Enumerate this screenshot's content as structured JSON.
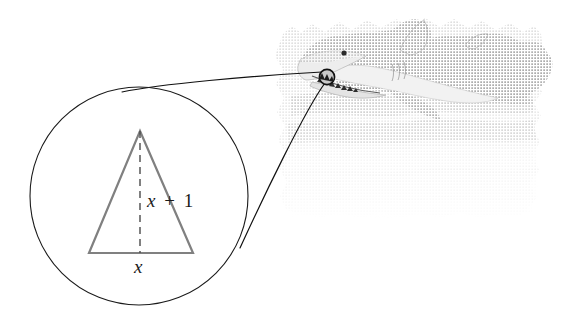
{
  "figure": {
    "kind": "math-textbook-illustration",
    "background_color": "#ffffff"
  },
  "magnifier": {
    "circle": {
      "center_x": 139,
      "center_y": 196,
      "radius": 109,
      "stroke_color": "#1a1a1a",
      "stroke_width": 1.1,
      "fill": "none"
    },
    "leader_lines": {
      "stroke_color": "#111111",
      "stroke_width": 1.2,
      "upper": {
        "x1": 146,
        "y1": 88,
        "x2": 325,
        "y2": 73
      },
      "lower": {
        "x1": 243,
        "y1": 246,
        "x2": 327,
        "y2": 84
      }
    }
  },
  "triangle": {
    "stroke_color": "#808080",
    "stroke_width": 2.2,
    "apex": {
      "x": 140,
      "y": 131
    },
    "base_left": {
      "x": 89,
      "y": 253
    },
    "base_right": {
      "x": 193,
      "y": 253
    },
    "altitude": {
      "from": {
        "x": 140,
        "y": 131
      },
      "to": {
        "x": 140,
        "y": 253
      },
      "dash_pattern": "7,5",
      "stroke_color": "#4a4a4a",
      "stroke_width": 1.4
    }
  },
  "labels": {
    "height": {
      "variable": "x",
      "operator": "+",
      "constant": "1",
      "full_text": "x + 1",
      "x": 147,
      "y": 207,
      "font_size": 19
    },
    "base": {
      "variable": "x",
      "full_text": "x",
      "x": 134,
      "y": 273,
      "font_size": 19
    }
  },
  "shark": {
    "name": "shark-illustration",
    "body_color": "#9a9a9a",
    "belly_color": "#efefef",
    "outline_color": "#8a8a8a",
    "wash_color": "#c9c9c9",
    "eye": {
      "x": 344,
      "y": 53,
      "r": 2.6,
      "color": "#2a2a2a"
    },
    "tooth_marker": {
      "x": 327,
      "y": 77,
      "r": 7.5,
      "stroke_color": "#111111",
      "fill_color": "#d8d8d8"
    }
  }
}
